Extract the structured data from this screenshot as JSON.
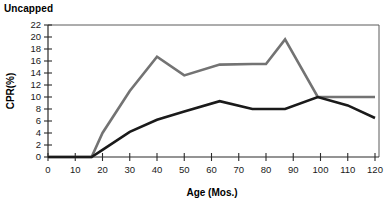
{
  "chart_title": "Uncapped",
  "axis_titles": {
    "x": "Age (Mos.)",
    "y": "CPR(%)"
  },
  "colors": {
    "series_gray": "#737373",
    "series_black": "#1a1a1a",
    "frame": "#5b5b5b",
    "axis": "#2b2b2b",
    "text": "#000000",
    "background": "#ffffff"
  },
  "y_ticks": [
    "0",
    "2",
    "4",
    "6",
    "8",
    "10",
    "12",
    "14",
    "16",
    "18",
    "20",
    "22"
  ],
  "x_ticks": [
    "0",
    "10",
    "20",
    "30",
    "40",
    "50",
    "60",
    "70",
    "80",
    "90",
    "100",
    "110",
    "120"
  ],
  "chart_data": {
    "type": "line",
    "title": "Uncapped",
    "xlabel": "Age (Mos.)",
    "ylabel": "CPR(%)",
    "xlim": [
      0,
      120
    ],
    "ylim": [
      0,
      22
    ],
    "xtick_step": 10,
    "ytick_step": 2,
    "grid": false,
    "legend": "none",
    "series": [
      {
        "name": "gray-series",
        "color": "#737373",
        "stroke_width": 2.6,
        "x": [
          0,
          10,
          16,
          20,
          30,
          40,
          50,
          63,
          75,
          80,
          87,
          99,
          110,
          120
        ],
        "y": [
          0,
          0,
          0,
          4.0,
          11.0,
          16.7,
          13.6,
          15.4,
          15.5,
          15.5,
          19.6,
          10.0,
          10.0,
          10.0
        ]
      },
      {
        "name": "black-series",
        "color": "#1a1a1a",
        "stroke_width": 2.6,
        "x": [
          0,
          10,
          16,
          20,
          30,
          40,
          50,
          63,
          75,
          87,
          99,
          110,
          120
        ],
        "y": [
          0,
          0,
          0,
          1.2,
          4.2,
          6.2,
          7.6,
          9.3,
          8.0,
          8.0,
          10.0,
          8.6,
          6.5
        ]
      }
    ]
  }
}
